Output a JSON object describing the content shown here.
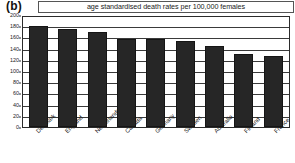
{
  "panel": {
    "label": "(b)"
  },
  "chart_data": {
    "type": "bar",
    "title": "age standardised death rates per 100,000 females",
    "subtitle": "",
    "xlabel": "",
    "ylabel": "",
    "ylim": [
      0,
      200
    ],
    "yticks": [
      0,
      20,
      40,
      60,
      80,
      100,
      120,
      140,
      160,
      180,
      200
    ],
    "ytick_labels": [
      "0",
      "20",
      "40",
      "60",
      "80",
      "100",
      "120",
      "140",
      "160",
      "180",
      "200"
    ],
    "grid": true,
    "legend": "none",
    "categories": [
      "Denmark",
      "England",
      "Netherlands",
      "Canada",
      "Germany",
      "Sweden",
      "Australia",
      "Finland",
      "France"
    ],
    "values": [
      180,
      175,
      170,
      158,
      157,
      153,
      145,
      131,
      127
    ],
    "bar_color": "#262626",
    "series": [
      {
        "name": "age standardised death rates per 100,000 females",
        "values": [
          180,
          175,
          170,
          158,
          157,
          153,
          145,
          131,
          127
        ]
      }
    ]
  }
}
